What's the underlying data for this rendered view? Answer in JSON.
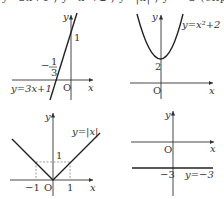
{
  "header_fragment": {
    "text": "y=3x+1 , y=x²+2 , y=|x| , y=−3 (clipped line)"
  },
  "graphs": [
    {
      "id": "linear",
      "equation": "y=3x+1",
      "axis_x": "x",
      "axis_y": "y",
      "origin": "O",
      "labels": {
        "y_intercept": "1",
        "x_intercept_num": "1",
        "x_intercept_den": "3",
        "x_intercept_sign": "−"
      }
    },
    {
      "id": "parabola",
      "equation": "y=x²+2",
      "axis_x": "x",
      "axis_y": "y",
      "origin": "O",
      "labels": {
        "vertex_y": "2"
      }
    },
    {
      "id": "absolute",
      "equation": "y=|x|",
      "axis_x": "x",
      "axis_y": "y",
      "origin": "O",
      "labels": {
        "y_one": "1",
        "x_neg_one": "−1",
        "x_one": "1"
      }
    },
    {
      "id": "constant",
      "equation": "y=−3",
      "axis_x": "x",
      "axis_y": "y",
      "origin": "O",
      "labels": {
        "y_neg_three": "−3"
      }
    }
  ],
  "colors": {
    "curve": "#222222",
    "axis": "#333333",
    "dashed": "#777777"
  }
}
